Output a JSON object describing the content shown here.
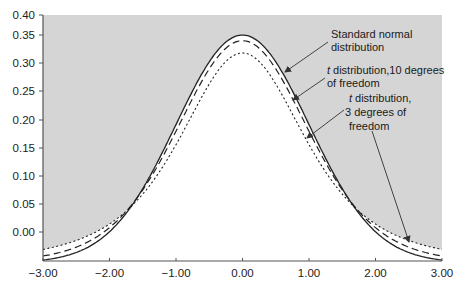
{
  "chart_data": {
    "type": "line",
    "title": "",
    "xlabel": "",
    "ylabel": "",
    "xlim": [
      -3.0,
      3.0
    ],
    "ylim": [
      -0.05,
      0.4
    ],
    "grid": false,
    "legend": "annotations",
    "x_ticks": [
      "-3.00",
      "-2.00",
      "-1.00",
      "0.00",
      "1.00",
      "2.00",
      "3.00"
    ],
    "y_ticks": [
      "0.40",
      "0.35",
      "0.30",
      "0.25",
      "0.20",
      "0.15",
      "0.10",
      "0.05",
      "0.00"
    ],
    "series": [
      {
        "name": "Standard normal distribution",
        "style": "solid",
        "peak": 0.3989,
        "df": null
      },
      {
        "name": "t distribution, 10 degrees of freedom",
        "style": "dashed",
        "peak": 0.3891,
        "df": 10
      },
      {
        "name": "t distribution, 3 degrees of freedom",
        "style": "dotted",
        "peak": 0.3676,
        "df": 3
      }
    ],
    "annotations": [
      {
        "lines": [
          "Standard normal",
          "distribution"
        ],
        "italic_prefix": ""
      },
      {
        "lines": [
          "distribution,10 degrees",
          "of freedom"
        ],
        "italic_prefix": "t"
      },
      {
        "lines": [
          "distribution,",
          "3 degrees of",
          "freedom"
        ],
        "italic_prefix": "t"
      }
    ]
  },
  "colors": {
    "background_shade": "#d5d5d5",
    "curve_area": "#ffffff",
    "line": "#222222",
    "axis": "#555555"
  }
}
